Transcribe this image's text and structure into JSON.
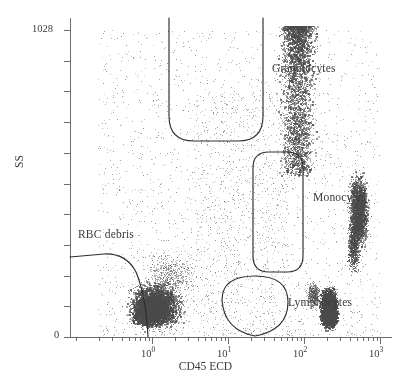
{
  "chart_data": {
    "type": "scatter",
    "title": "",
    "xlabel": "CD45 ECD",
    "ylabel": "SS",
    "x_scale": "log",
    "y_scale": "linear",
    "xlim": [
      0,
      1000
    ],
    "ylim": [
      0,
      1028
    ],
    "grid": false,
    "legend": "none",
    "point_color": "#4a4a4a",
    "xticks": [
      {
        "value": 1,
        "label": "10",
        "exponent": "0",
        "px": 152
      },
      {
        "value": 10,
        "label": "10",
        "exponent": "1",
        "px": 228
      },
      {
        "value": 100,
        "label": "10",
        "exponent": "2",
        "px": 304
      },
      {
        "value": 1000,
        "label": "10",
        "exponent": "3",
        "px": 380
      }
    ],
    "yticks": [
      {
        "value": 1028,
        "label": "1028",
        "px": 30
      },
      {
        "value": 0,
        "label": "0",
        "px": 337
      }
    ],
    "populations": [
      {
        "name": "Granulocytes",
        "label": "Granulocytes",
        "gate_shape": "open-bottom-rounded-column",
        "label_x": 272,
        "label_y": 70,
        "x_range_log10": [
          1.3,
          2.55
        ],
        "y_range": [
          560,
          1028
        ],
        "density": "high",
        "n_points": 3400
      },
      {
        "name": "Monocytes",
        "label": "Monocytes",
        "gate_shape": "rounded-capsule",
        "label_x": 313,
        "label_y": 199,
        "x_range_log10": [
          2.4,
          3.05
        ],
        "y_range": [
          225,
          620
        ],
        "density": "high",
        "n_points": 2600
      },
      {
        "name": "Lymphocytes",
        "label": "Lymphocytes",
        "gate_shape": "ellipse",
        "label_x": 288,
        "label_y": 304,
        "x_range_log10": [
          2.0,
          2.6
        ],
        "y_range": [
          0,
          210
        ],
        "density": "very-high",
        "n_points": 3800
      },
      {
        "name": "RBC debris",
        "label": "RBC debris",
        "gate_shape": "arc-to-axis",
        "label_x": 78,
        "label_y": 236,
        "x_range_log10": [
          -0.6,
          0.95
        ],
        "y_range": [
          0,
          270
        ],
        "density": "high",
        "n_points": 4200
      },
      {
        "name": "background",
        "label": "",
        "gate_shape": "none",
        "x_range_log10": [
          -0.7,
          3.0
        ],
        "y_range": [
          0,
          1028
        ],
        "density": "sparse",
        "n_points": 2200
      }
    ]
  },
  "axes": {
    "x_title": "CD45 ECD",
    "y_title": "SS",
    "y_max_label": "1028",
    "y_min_label": "0"
  },
  "labels": {
    "granulocytes": "Granulocytes",
    "monocytes": "Monocytes",
    "lymphocytes": "Lymphocytes",
    "rbc_debris": "RBC debris"
  },
  "colors": {
    "point": "#4a4a4a",
    "axis": "#6d6d6d",
    "gate": "#2e2e2e",
    "text": "#3b3b3b",
    "background": "#ffffff"
  }
}
